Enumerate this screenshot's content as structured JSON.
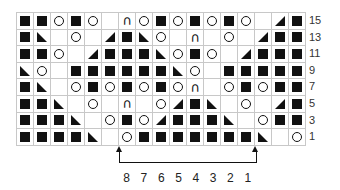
{
  "chart": {
    "columns": 17,
    "rows_shown": [
      15,
      13,
      11,
      9,
      7,
      5,
      3,
      1
    ],
    "legend_symbols": {
      "sq": "knit-on-ws / filled square",
      "yo": "yarn over (circle)",
      "ssk": "left-leaning decrease (triangle lower-left)",
      "k2t": "right-leaning decrease (triangle lower-right)",
      "cdd": "double decrease (arch)",
      "blank": "no stitch / knit"
    },
    "grid": [
      [
        "sq",
        "sq",
        "yo",
        "sq",
        "yo",
        "blank",
        "cdd",
        "yo",
        "sq",
        "yo",
        "sq",
        "yo",
        "sq",
        "yo",
        "blank",
        "k2t",
        "sq"
      ],
      [
        "sq",
        "ssk",
        "blank",
        "yo",
        "blank",
        "k2t",
        "sq",
        "ssk",
        "yo",
        "blank",
        "cdd",
        "blank",
        "yo",
        "blank",
        "k2t",
        "sq",
        "sq"
      ],
      [
        "sq",
        "sq",
        "yo",
        "blank",
        "k2t",
        "sq",
        "sq",
        "sq",
        "ssk",
        "yo",
        "sq",
        "yo",
        "blank",
        "k2t",
        "sq",
        "sq",
        "sq"
      ],
      [
        "ssk",
        "yo",
        "blank",
        "sq",
        "sq",
        "sq",
        "sq",
        "sq",
        "sq",
        "ssk",
        "yo",
        "blank",
        "sq",
        "sq",
        "sq",
        "sq",
        "sq"
      ],
      [
        "sq",
        "ssk",
        "blank",
        "yo",
        "sq",
        "yo",
        "sq",
        "yo",
        "sq",
        "yo",
        "cdd",
        "blank",
        "yo",
        "sq",
        "yo",
        "sq",
        "sq"
      ],
      [
        "sq",
        "sq",
        "ssk",
        "blank",
        "yo",
        "blank",
        "cdd",
        "blank",
        "yo",
        "k2t",
        "sq",
        "ssk",
        "blank",
        "yo",
        "blank",
        "k2t",
        "sq"
      ],
      [
        "sq",
        "sq",
        "sq",
        "ssk",
        "blank",
        "yo",
        "sq",
        "yo",
        "k2t",
        "sq",
        "sq",
        "sq",
        "ssk",
        "blank",
        "yo",
        "sq",
        "sq"
      ],
      [
        "sq",
        "sq",
        "sq",
        "sq",
        "ssk",
        "blank",
        "yo",
        "sq",
        "sq",
        "sq",
        "sq",
        "sq",
        "sq",
        "sq",
        "ssk",
        "blank",
        "yo",
        "sq"
      ]
    ],
    "row_labels": [
      "15",
      "13",
      "11",
      "9",
      "7",
      "5",
      "3",
      "1"
    ],
    "repeat": {
      "start_col": 7,
      "end_col": 14,
      "stitch_numbers": [
        "8",
        "7",
        "6",
        "5",
        "4",
        "3",
        "2",
        "1"
      ]
    },
    "colors": {
      "grid_line": "#c8c8c8",
      "symbol": "#111111"
    }
  }
}
